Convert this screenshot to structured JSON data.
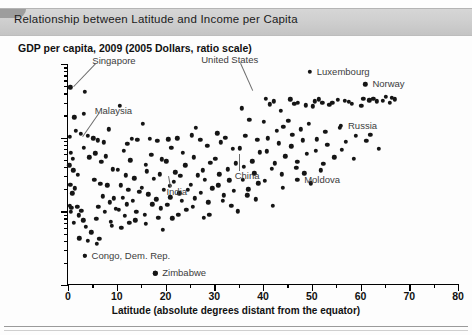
{
  "figure": {
    "title": "Relationship between Latitude and Income per Capita",
    "y_axis_title": "GDP per capita, 2009 (2005 Dollars, ratio scale)",
    "x_axis_title": "Latitude (absolute degrees distant from the equator)"
  },
  "chart_data": {
    "type": "scatter",
    "title": "Relationship between Latitude and Income per Capita",
    "xlabel": "Latitude (absolute degrees distant from the equator)",
    "ylabel": "GDP per capita, 2009 (2005 Dollars, ratio scale)",
    "xlim": [
      0,
      80
    ],
    "ylim": [
      100,
      100000
    ],
    "yscale": "log",
    "xscale": "linear",
    "grid": false,
    "legend": "none",
    "xticks": [
      0,
      10,
      20,
      30,
      40,
      50,
      60,
      70,
      80
    ],
    "xtick_labels": [
      "0",
      "10",
      "20",
      "30",
      "40",
      "50",
      "60",
      "70",
      "80"
    ],
    "xminor_ticks": [
      5,
      15,
      25,
      35,
      45,
      55,
      65,
      75
    ],
    "yticks": [
      100,
      1000,
      10000,
      100000
    ],
    "ytick_labels": [
      "100",
      "1,000",
      "10,000",
      "100,000"
    ],
    "points": [
      [
        0.5,
        48000
      ],
      [
        3.5,
        42000
      ],
      [
        1.3,
        19000
      ],
      [
        3.2,
        21000
      ],
      [
        0.4,
        10200
      ],
      [
        1.6,
        12500
      ],
      [
        2.6,
        11200
      ],
      [
        4.0,
        10500
      ],
      [
        0.6,
        6200
      ],
      [
        1.0,
        5200
      ],
      [
        3.3,
        7300
      ],
      [
        4.4,
        5400
      ],
      [
        0.3,
        4200
      ],
      [
        1.1,
        3600
      ],
      [
        2.0,
        3150
      ],
      [
        0.5,
        2300
      ],
      [
        1.4,
        2050
      ],
      [
        0.9,
        1750
      ],
      [
        0.4,
        1180
      ],
      [
        0.7,
        1120
      ],
      [
        1.9,
        1150
      ],
      [
        2.7,
        1020
      ],
      [
        0.6,
        980
      ],
      [
        2.2,
        880
      ],
      [
        3.1,
        760
      ],
      [
        1.2,
        700
      ],
      [
        3.6,
        620
      ],
      [
        4.8,
        520
      ],
      [
        2.3,
        430
      ],
      [
        4.1,
        395
      ],
      [
        5.9,
        360
      ],
      [
        6.4,
        420
      ],
      [
        3.4,
        250
      ],
      [
        5.2,
        9800
      ],
      [
        6.1,
        9200
      ],
      [
        7.3,
        8700
      ],
      [
        5.6,
        6100
      ],
      [
        7.8,
        5600
      ],
      [
        6.8,
        4700
      ],
      [
        8.4,
        13000
      ],
      [
        9.2,
        3700
      ],
      [
        5.4,
        2700
      ],
      [
        6.6,
        2350
      ],
      [
        8.1,
        2250
      ],
      [
        7.1,
        1600
      ],
      [
        9.4,
        1500
      ],
      [
        8.6,
        1320
      ],
      [
        6.2,
        1150
      ],
      [
        9.8,
        1080
      ],
      [
        7.6,
        980
      ],
      [
        5.8,
        790
      ],
      [
        8.8,
        720
      ],
      [
        9.0,
        640
      ],
      [
        10.6,
        27000
      ],
      [
        12.2,
        8200
      ],
      [
        11.4,
        6600
      ],
      [
        13.1,
        9700
      ],
      [
        14.2,
        9300
      ],
      [
        12.8,
        4900
      ],
      [
        10.2,
        3650
      ],
      [
        11.9,
        3100
      ],
      [
        13.6,
        2800
      ],
      [
        10.8,
        2250
      ],
      [
        12.4,
        1950
      ],
      [
        14.6,
        1850
      ],
      [
        11.2,
        1520
      ],
      [
        13.3,
        1400
      ],
      [
        12.0,
        1250
      ],
      [
        10.4,
        1050
      ],
      [
        14.0,
        980
      ],
      [
        11.6,
        870
      ],
      [
        13.8,
        760
      ],
      [
        12.6,
        700
      ],
      [
        10.9,
        600
      ],
      [
        15.4,
        15500
      ],
      [
        16.8,
        9600
      ],
      [
        18.3,
        9100
      ],
      [
        17.1,
        5800
      ],
      [
        19.2,
        5100
      ],
      [
        15.9,
        4300
      ],
      [
        16.2,
        3500
      ],
      [
        18.8,
        3200
      ],
      [
        17.6,
        2750
      ],
      [
        15.2,
        2100
      ],
      [
        19.6,
        1950
      ],
      [
        16.5,
        1700
      ],
      [
        18.1,
        1450
      ],
      [
        17.3,
        1250
      ],
      [
        19.0,
        1100
      ],
      [
        15.7,
        900
      ],
      [
        18.5,
        820
      ],
      [
        16.0,
        680
      ],
      [
        19.4,
        560
      ],
      [
        17.9,
        145
      ],
      [
        20.6,
        9500
      ],
      [
        22.4,
        9800
      ],
      [
        21.2,
        7300
      ],
      [
        23.6,
        6200
      ],
      [
        20.2,
        4800
      ],
      [
        24.1,
        4200
      ],
      [
        22.0,
        3400
      ],
      [
        23.0,
        3050
      ],
      [
        21.7,
        2500
      ],
      [
        20.9,
        2200
      ],
      [
        24.6,
        1950
      ],
      [
        22.8,
        1750
      ],
      [
        21.0,
        1550
      ],
      [
        23.3,
        1380
      ],
      [
        20.4,
        1220
      ],
      [
        24.3,
        1050
      ],
      [
        22.6,
        900
      ],
      [
        21.4,
        800
      ],
      [
        25.4,
        10800
      ],
      [
        27.1,
        9400
      ],
      [
        26.2,
        13500
      ],
      [
        28.6,
        7800
      ],
      [
        25.8,
        5400
      ],
      [
        29.2,
        4600
      ],
      [
        27.6,
        3600
      ],
      [
        26.6,
        3100
      ],
      [
        28.1,
        2700
      ],
      [
        25.2,
        2300
      ],
      [
        29.6,
        2050
      ],
      [
        27.3,
        1800
      ],
      [
        26.0,
        1500
      ],
      [
        28.8,
        1320
      ],
      [
        25.6,
        1150
      ],
      [
        29.0,
        900
      ],
      [
        27.9,
        820
      ],
      [
        30.6,
        11500
      ],
      [
        32.3,
        9900
      ],
      [
        31.4,
        8600
      ],
      [
        33.8,
        7100
      ],
      [
        30.2,
        5200
      ],
      [
        34.4,
        4500
      ],
      [
        32.8,
        3700
      ],
      [
        31.0,
        3200
      ],
      [
        33.1,
        2650
      ],
      [
        30.8,
        2250
      ],
      [
        34.0,
        1900
      ],
      [
        32.0,
        1650
      ],
      [
        31.8,
        1400
      ],
      [
        33.5,
        1180
      ],
      [
        34.8,
        1000
      ],
      [
        35.6,
        25000
      ],
      [
        37.2,
        17500
      ],
      [
        36.4,
        10500
      ],
      [
        38.8,
        9400
      ],
      [
        35.2,
        7200
      ],
      [
        39.4,
        6300
      ],
      [
        37.8,
        4800
      ],
      [
        36.0,
        4000
      ],
      [
        38.2,
        3300
      ],
      [
        35.8,
        2700
      ],
      [
        39.0,
        2400
      ],
      [
        37.0,
        2000
      ],
      [
        36.8,
        1650
      ],
      [
        38.5,
        1450
      ],
      [
        40.6,
        34000
      ],
      [
        42.2,
        31000
      ],
      [
        41.4,
        28500
      ],
      [
        43.6,
        23000
      ],
      [
        40.2,
        16500
      ],
      [
        44.2,
        14000
      ],
      [
        42.8,
        12500
      ],
      [
        41.0,
        9800
      ],
      [
        43.2,
        8400
      ],
      [
        40.8,
        6500
      ],
      [
        44.6,
        5600
      ],
      [
        42.4,
        4500
      ],
      [
        41.8,
        3800
      ],
      [
        43.8,
        3200
      ],
      [
        40.4,
        2600
      ],
      [
        44.0,
        2100
      ],
      [
        42.0,
        1200
      ],
      [
        45.6,
        33000
      ],
      [
        47.2,
        30000
      ],
      [
        46.4,
        29000
      ],
      [
        48.8,
        27500
      ],
      [
        45.2,
        17000
      ],
      [
        49.4,
        15500
      ],
      [
        47.8,
        13000
      ],
      [
        46.0,
        11000
      ],
      [
        48.2,
        9200
      ],
      [
        45.8,
        7600
      ],
      [
        49.0,
        6000
      ],
      [
        47.0,
        4700
      ],
      [
        46.8,
        3900
      ],
      [
        48.5,
        3300
      ],
      [
        49.8,
        2400
      ],
      [
        50.6,
        31000
      ],
      [
        52.2,
        29500
      ],
      [
        51.4,
        33000
      ],
      [
        53.6,
        28000
      ],
      [
        50.2,
        26500
      ],
      [
        54.2,
        30000
      ],
      [
        52.8,
        12000
      ],
      [
        51.0,
        9500
      ],
      [
        53.2,
        8000
      ],
      [
        50.8,
        6600
      ],
      [
        54.6,
        5400
      ],
      [
        52.4,
        4400
      ],
      [
        51.8,
        3600
      ],
      [
        55.4,
        32500
      ],
      [
        56.8,
        31500
      ],
      [
        57.6,
        30500
      ],
      [
        58.2,
        29000
      ],
      [
        55.8,
        13500
      ],
      [
        59.0,
        10500
      ],
      [
        57.0,
        8800
      ],
      [
        56.2,
        6900
      ],
      [
        58.6,
        5200
      ],
      [
        60.6,
        34000
      ],
      [
        61.8,
        32000
      ],
      [
        62.6,
        33500
      ],
      [
        63.4,
        31000
      ],
      [
        60.2,
        27000
      ],
      [
        62.0,
        11000
      ],
      [
        61.2,
        9000
      ],
      [
        63.8,
        7000
      ],
      [
        65.2,
        36000
      ],
      [
        66.4,
        34500
      ],
      [
        67.0,
        33000
      ],
      [
        64.6,
        31500
      ],
      [
        66.0,
        29500
      ]
    ],
    "annotations": [
      {
        "label": "Singapore",
        "x": 1.3,
        "y": 48000,
        "marker": false
      },
      {
        "label": "Malaysia",
        "x": 3.0,
        "y": 10200,
        "marker": false
      },
      {
        "label": "Congo, Dem. Rep.",
        "x": 3.4,
        "y": 250,
        "marker": true
      },
      {
        "label": "Zimbabwe",
        "x": 17.9,
        "y": 145,
        "marker": true
      },
      {
        "label": "India",
        "x": 20.6,
        "y": 3000,
        "marker": false
      },
      {
        "label": "China",
        "x": 35.0,
        "y": 6000,
        "marker": false
      },
      {
        "label": "United States",
        "x": 38.0,
        "y": 45000,
        "marker": false
      },
      {
        "label": "Luxembourg",
        "x": 49.6,
        "y": 78000,
        "marker": true
      },
      {
        "label": "Norway",
        "x": 61.0,
        "y": 53000,
        "marker": true
      },
      {
        "label": "Moldova",
        "x": 47.0,
        "y": 2700,
        "marker": true
      },
      {
        "label": "Russia",
        "x": 56.0,
        "y": 14500,
        "marker": true
      }
    ]
  }
}
